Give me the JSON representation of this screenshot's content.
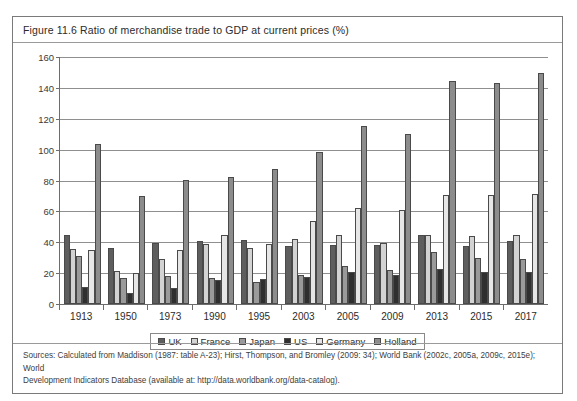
{
  "figure": {
    "caption": "Figure 11.6  Ratio of merchandise trade to GDP at current prices (%)",
    "sources_line1": "Sources:  Calculated from Maddison (1987: table A-23); Hirst, Thompson, and Bromley (2009: 34); World Bank (2002c, 2005a, 2009c, 2015e); World",
    "sources_line2": "Development Indicators Database (available at: http://data.worldbank.org/data-catalog)."
  },
  "legend": {
    "items": [
      {
        "label": "UK",
        "color": "#5e5e5e",
        "swatch_name": "legend-swatch-uk"
      },
      {
        "label": "France",
        "color": "#d3d3d3",
        "swatch_name": "legend-swatch-france"
      },
      {
        "label": "Japan",
        "color": "#9a9a9a",
        "swatch_name": "legend-swatch-japan"
      },
      {
        "label": "US",
        "color": "#2f2f2f",
        "swatch_name": "legend-swatch-us"
      },
      {
        "label": "Germany",
        "color": "#e6e6e6",
        "swatch_name": "legend-swatch-germany"
      },
      {
        "label": "Holland",
        "color": "#8c8c8c",
        "swatch_name": "legend-swatch-holland"
      }
    ]
  },
  "chart_data": {
    "type": "bar",
    "title": "Figure 11.6  Ratio of merchandise trade to GDP at current prices (%)",
    "xlabel": "",
    "ylabel": "",
    "ylim": [
      0,
      160
    ],
    "yticks": [
      0,
      20,
      40,
      60,
      80,
      100,
      120,
      140,
      160
    ],
    "grid": true,
    "legend_position": "bottom",
    "categories": [
      "1913",
      "1950",
      "1973",
      "1990",
      "1995",
      "2003",
      "2005",
      "2009",
      "2013",
      "2015",
      "2017"
    ],
    "series": [
      {
        "name": "UK",
        "color": "#5e5e5e",
        "values": [
          44.7,
          36.0,
          39.3,
          40.6,
          41.3,
          37.7,
          38.0,
          38.1,
          45.0,
          37.8,
          41.0
        ]
      },
      {
        "name": "France",
        "color": "#d3d3d3",
        "values": [
          35.4,
          21.2,
          29.0,
          38.6,
          36.6,
          42.0,
          45.0,
          39.5,
          45.0,
          44.0,
          44.5
        ]
      },
      {
        "name": "Japan",
        "color": "#9a9a9a",
        "values": [
          31.4,
          16.9,
          18.3,
          17.0,
          14.1,
          19.1,
          24.4,
          22.3,
          34.0,
          30.0,
          29.0
        ]
      },
      {
        "name": "US",
        "color": "#2f2f2f",
        "values": [
          11.2,
          7.0,
          10.5,
          15.6,
          16.2,
          17.6,
          20.5,
          18.7,
          23.0,
          20.5,
          21.0
        ]
      },
      {
        "name": "Germany",
        "color": "#e6e6e6",
        "values": [
          35.1,
          20.1,
          35.2,
          45.0,
          38.7,
          53.7,
          62.0,
          60.9,
          70.5,
          70.5,
          71.5
        ]
      },
      {
        "name": "Holland",
        "color": "#8c8c8c",
        "values": [
          103.6,
          70.2,
          80.1,
          82.5,
          87.5,
          98.6,
          115.3,
          110.2,
          144.6,
          143.0,
          149.5
        ]
      }
    ]
  }
}
